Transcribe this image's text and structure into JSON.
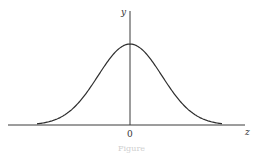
{
  "chart_data": {
    "type": "line",
    "title": "",
    "xlabel": "z",
    "ylabel": "y",
    "x_ticks": [
      {
        "value": 0,
        "label": "0"
      }
    ],
    "y_ticks": [],
    "grid": false,
    "legend": null,
    "series": [
      {
        "name": "normal curve",
        "function": "gaussian",
        "mean": 0,
        "sd": 1,
        "x_range": [
          -2.9,
          2.9
        ],
        "x": [
          -2.9,
          -2.5,
          -2,
          -1.5,
          -1,
          -0.5,
          0,
          0.5,
          1,
          1.5,
          2,
          2.5,
          2.9
        ],
        "y": [
          0.006,
          0.018,
          0.054,
          0.13,
          0.242,
          0.352,
          0.399,
          0.352,
          0.242,
          0.13,
          0.054,
          0.018,
          0.006
        ]
      }
    ],
    "caption": "Figure"
  },
  "labels": {
    "y_axis": "y",
    "x_axis": "z",
    "origin": "0",
    "caption": "Figure"
  },
  "layout": {
    "origin_px": [
      130,
      125
    ],
    "sigma_px": 32,
    "peak_px": 81,
    "x_axis_px": [
      8,
      245
    ],
    "y_axis_top_px": 11,
    "curve_range_px": [
      37,
      222
    ]
  },
  "colors": {
    "axis": "#3a3a3a",
    "curve": "#2e2e2e",
    "background": "#ffffff"
  }
}
